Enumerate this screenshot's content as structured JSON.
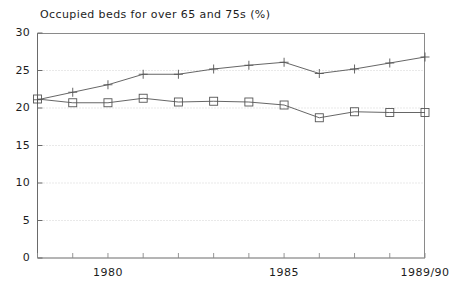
{
  "chart_data": {
    "type": "line",
    "title": "Occupied beds for over 65 and 75s (%)",
    "xlabel": "",
    "ylabel": "",
    "ylim": [
      0,
      30
    ],
    "yticks": [
      0,
      5,
      10,
      15,
      20,
      25,
      30
    ],
    "grid": true,
    "grid_style": "dotted-horizontal",
    "legend": "none",
    "x": [
      1978,
      1979,
      1980,
      1981,
      1982,
      1983,
      1984,
      1985,
      1986,
      1987,
      1988,
      1989
    ],
    "xtick_labels": [
      "1980",
      "1985",
      "1989/90"
    ],
    "xtick_values": [
      1980,
      1985,
      1989
    ],
    "series": [
      {
        "name": "over 65s",
        "marker": "plus",
        "color": "#555555",
        "values": [
          21.1,
          22.1,
          23.1,
          24.5,
          24.5,
          25.2,
          25.7,
          26.1,
          24.6,
          25.2,
          26.0,
          26.8
        ]
      },
      {
        "name": "over 75s",
        "marker": "square",
        "color": "#555555",
        "values": [
          21.2,
          20.7,
          20.7,
          21.3,
          20.8,
          20.9,
          20.8,
          20.4,
          18.7,
          19.5,
          19.4,
          19.4
        ]
      }
    ]
  },
  "axes": {
    "y_axis_name": "percentage-axis",
    "x_axis_name": "year-axis"
  }
}
